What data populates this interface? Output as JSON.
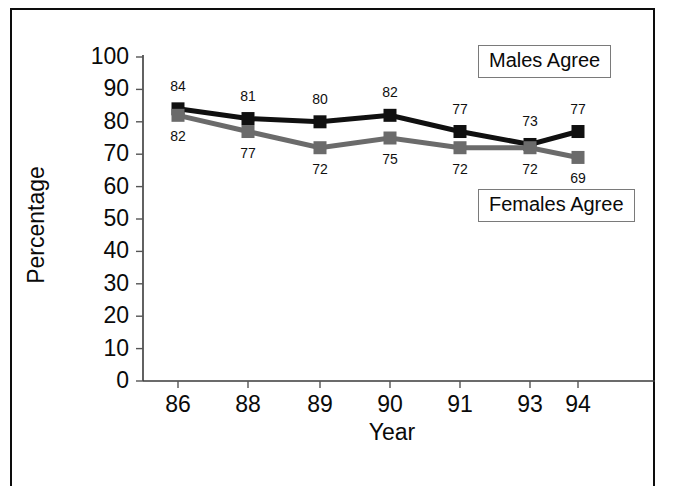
{
  "figure": {
    "frame_color": "#0d0d0d",
    "background": "#ffffff"
  },
  "chart_data": {
    "type": "line",
    "title": "",
    "xlabel": "Year",
    "ylabel": "Percentage",
    "categories": [
      "86",
      "88",
      "89",
      "90",
      "91",
      "93",
      "94"
    ],
    "x": [
      "86",
      "88",
      "89",
      "90",
      "91",
      "93",
      "94"
    ],
    "ylim": [
      0,
      100
    ],
    "yticks": [
      0,
      10,
      20,
      30,
      40,
      50,
      60,
      70,
      80,
      90,
      100
    ],
    "grid": false,
    "legend_position": "inside-right",
    "series": [
      {
        "name": "Males Agree",
        "color": "#101010",
        "marker": "square",
        "values": [
          84,
          81,
          80,
          82,
          77,
          73,
          77
        ],
        "labels": [
          "84",
          "81",
          "80",
          "82",
          "77",
          "73",
          "77"
        ]
      },
      {
        "name": "Females Agree",
        "color": "#6b6b6b",
        "marker": "square",
        "values": [
          82,
          77,
          72,
          75,
          72,
          72,
          69
        ],
        "labels": [
          "82",
          "77",
          "72",
          "75",
          "72",
          "72",
          "69"
        ]
      }
    ],
    "annotations": [
      {
        "text": "Males Agree",
        "kind": "legend-box"
      },
      {
        "text": "Females Agree",
        "kind": "legend-box"
      }
    ]
  },
  "axes": {
    "y_title": "Percentage",
    "x_title": "Year",
    "y_tick_labels": [
      "100",
      "90",
      "80",
      "70",
      "60",
      "50",
      "40",
      "30",
      "20",
      "10",
      "0"
    ],
    "x_tick_labels": [
      "86",
      "88",
      "89",
      "90",
      "91",
      "93",
      "94"
    ]
  },
  "legend": {
    "males_label": "Males Agree",
    "females_label": "Females Agree"
  },
  "point_labels": {
    "males": [
      "84",
      "81",
      "80",
      "82",
      "77",
      "73",
      "77"
    ],
    "females": [
      "82",
      "77",
      "72",
      "75",
      "72",
      "72",
      "69"
    ]
  }
}
